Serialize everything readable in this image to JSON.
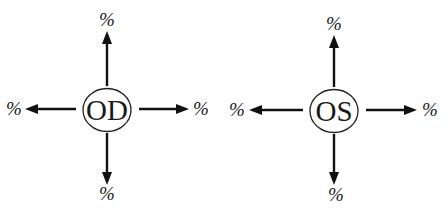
{
  "diagram": {
    "colors": {
      "background": "#ffffff",
      "ink": "#111111"
    },
    "eyes": [
      {
        "id": "od",
        "label": "OD",
        "directions": {
          "up": "%",
          "down": "%",
          "left": "%",
          "right": "%"
        }
      },
      {
        "id": "os",
        "label": "OS",
        "directions": {
          "up": "%",
          "down": "%",
          "left": "%",
          "right": "%"
        }
      }
    ]
  }
}
